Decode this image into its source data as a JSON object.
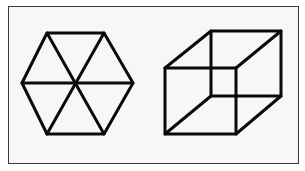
{
  "figure": {
    "frame": {
      "x": 8,
      "y": 6,
      "width": 291,
      "height": 158,
      "background": "#f7f7f7",
      "border": "#3a3a3a"
    },
    "shapes": [
      {
        "name": "hexagon-with-diagonals",
        "type": "hexagon",
        "vertices": [
          [
            47,
            33
          ],
          [
            104,
            33
          ],
          [
            133,
            83
          ],
          [
            104,
            134
          ],
          [
            47,
            134
          ],
          [
            22,
            83
          ]
        ],
        "center": [
          76,
          83
        ],
        "stroke": "#0a0a0a"
      },
      {
        "name": "wireframe-cube",
        "type": "necker-cube",
        "front_square": [
          [
            165,
            68
          ],
          [
            236,
            68
          ],
          [
            236,
            134
          ],
          [
            165,
            134
          ]
        ],
        "back_square": [
          [
            211,
            31
          ],
          [
            281,
            31
          ],
          [
            281,
            96
          ],
          [
            211,
            96
          ]
        ],
        "stroke": "#0a0a0a"
      }
    ]
  }
}
